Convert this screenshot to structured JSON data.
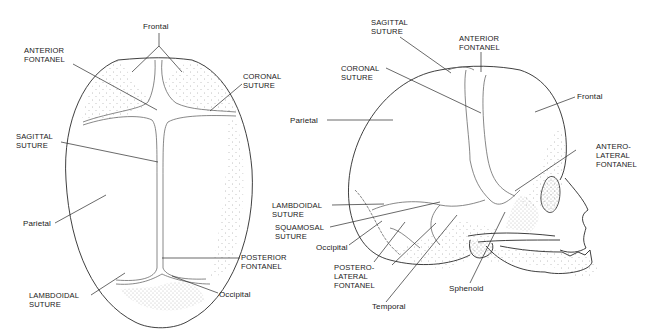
{
  "figure": {
    "top_view": {
      "labels": {
        "frontal": "Frontal",
        "anterior_fontanel": "ANTERIOR\nFONTANEL",
        "coronal_suture": "CORONAL\nSUTURE",
        "sagittal_suture": "SAGITTAL\nSUTURE",
        "parietal": "Parietal",
        "posterior_fontanel": "POSTERIOR\nFONTANEL",
        "lambdoidal_suture": "LAMBDOIDAL\nSUTURE",
        "occipital": "Occipital"
      }
    },
    "side_view": {
      "labels": {
        "sagittal_suture": "SAGITTAL\nSUTURE",
        "anterior_fontanel": "ANTERIOR\nFONTANEL",
        "coronal_suture": "CORONAL\nSUTURE",
        "parietal": "Parietal",
        "frontal": "Frontal",
        "anterolateral_fontanel": "ANTERO-\nLATERAL\nFONTANEL",
        "lambdoidal_suture": "LAMBDOIDAL\nSUTURE",
        "squamosal_suture": "SQUAMOSAL\nSUTURE",
        "occipital": "Occipital",
        "posterolateral_fontanel": "POSTERO-\nLATERAL\nFONTANEL",
        "temporal": "Temporal",
        "sphenoid": "Sphenoid"
      }
    },
    "colors": {
      "line": "#2a2a2a",
      "suture": "#6a6a6a",
      "stipple": "#8a8a8a",
      "background": "#ffffff"
    }
  }
}
